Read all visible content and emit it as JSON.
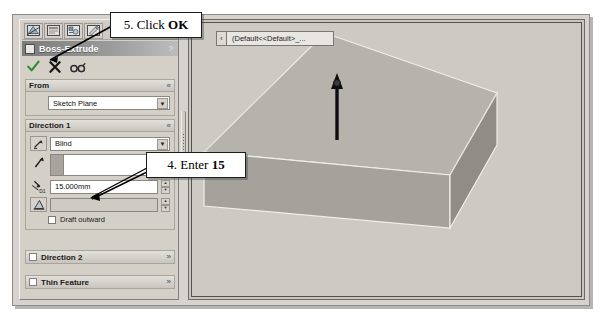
{
  "document": {
    "name_bar_text": "(Default<<Default>_...",
    "caret_icon": "chevron-left-icon"
  },
  "property_manager": {
    "toolbar": {
      "buttons": [
        {
          "name": "feature-manager-tree-icon",
          "label": ""
        },
        {
          "name": "property-manager-icon",
          "label": ""
        },
        {
          "name": "configuration-manager-icon",
          "label": ""
        },
        {
          "name": "display-manager-icon",
          "label": ""
        }
      ]
    },
    "title": "Boss-Extrude",
    "title_help": "?",
    "actions": [
      {
        "name": "ok-button",
        "icon": "green-check-icon",
        "label": "OK"
      },
      {
        "name": "cancel-button",
        "icon": "red-x-icon",
        "label": "Cancel"
      },
      {
        "name": "preview-button",
        "icon": "glasses-icon",
        "label": "Detailed Preview"
      }
    ],
    "groups": {
      "from": {
        "header": "From",
        "chevron": "«",
        "start_condition": "Sketch Plane",
        "dropdown_arrow": "▼"
      },
      "direction1": {
        "header": "Direction 1",
        "chevron": "«",
        "flip_icon": "reverse-direction-icon",
        "end_condition": "Blind",
        "dropdown_arrow": "▼",
        "direction_vector_icon": "direction-arrow-icon",
        "direction_vector_value": "",
        "direction_vector_placeholder": "",
        "depth_icon": "depth-dimension-icon",
        "depth_label": "D1",
        "depth_value": "15.000mm",
        "draft_icon": "draft-angle-icon",
        "draft_value": "",
        "draft_outward_label": "Draft outward",
        "spinner_up": "▲",
        "spinner_down": "▼"
      },
      "direction2": {
        "header": "Direction 2",
        "chevron": "»",
        "checked": false
      },
      "thin_feature": {
        "header": "Thin Feature",
        "chevron": "»",
        "checked": false
      }
    }
  },
  "callouts": [
    {
      "id": "callout-ok",
      "prefix": "5. Click ",
      "strong": "OK",
      "suffix": ""
    },
    {
      "id": "callout-15",
      "prefix": "4. Enter ",
      "strong": "15",
      "suffix": ""
    }
  ],
  "model": {
    "shape": "rectangular-block",
    "extrude_arrow": "extrusion-direction-arrow",
    "face_top_color": "#b9b6b0",
    "face_front_color": "#a09d97",
    "face_right_color": "#8f8c86",
    "background_color": "#cdcac4"
  },
  "colors": {
    "panel": "#d4d0c8",
    "title_bar_dark": "#7b7b7b",
    "ok_green": "#2f8b2f",
    "cancel_red": "#1d1d1d",
    "chevron_blue": "#33486b",
    "viewport_bg": "#cdcac4"
  }
}
